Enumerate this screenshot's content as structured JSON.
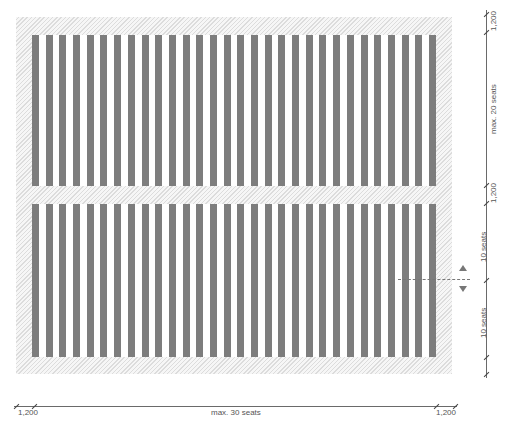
{
  "diagram": {
    "colors": {
      "seat_row": "#7d7d7d",
      "hatch": "#dcdcdc",
      "dimension": "#6a6a6a"
    },
    "blocks": [
      {
        "name": "upper-block",
        "rows": 30,
        "row_label": "max. 20 seats"
      },
      {
        "name": "lower-block",
        "rows": 30,
        "row_label": "10 seats + 10 seats"
      }
    ],
    "horizontal_dimension": {
      "left_margin": "1,200",
      "span": "max. 30 seats",
      "right_margin": "1,200"
    },
    "vertical_dimension": {
      "top_margin": "1,200",
      "upper_span": "max. 20 seats",
      "aisle": "1,200",
      "lower_span_1": "10 seats",
      "lower_span_2": "10 seats"
    },
    "indicators": {
      "split_line": "dashed split line",
      "arrows": [
        "up-arrow",
        "down-arrow"
      ]
    }
  }
}
